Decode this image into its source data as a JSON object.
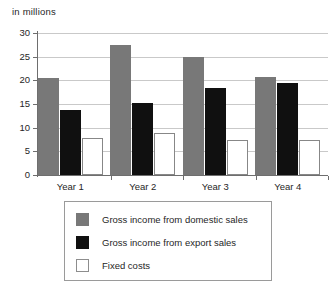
{
  "chart_data": {
    "type": "bar",
    "title": "",
    "subtitle": "",
    "unit_caption": "in millions",
    "xlabel": "",
    "ylabel": "",
    "categories": [
      "Year 1",
      "Year 2",
      "Year 3",
      "Year 4"
    ],
    "series": [
      {
        "name": "Gross income from domestic sales",
        "color": "#787878",
        "values": [
          20.5,
          27.4,
          24.9,
          20.7
        ]
      },
      {
        "name": "Gross income from export sales",
        "color": "#101010",
        "values": [
          13.7,
          15.3,
          18.3,
          19.4
        ]
      },
      {
        "name": "Fixed costs",
        "color": "#ffffff",
        "values": [
          7.8,
          8.8,
          7.3,
          7.3
        ]
      }
    ],
    "ylim": [
      0,
      30
    ],
    "yticks": [
      0,
      5,
      10,
      15,
      20,
      25,
      30
    ],
    "ytick_labels": [
      "0",
      "5",
      "10",
      "15",
      "20",
      "25",
      "30"
    ],
    "grid": true,
    "grid_axis": "y",
    "legend_position": "bottom"
  },
  "legend": {
    "entries": [
      {
        "label": "Gross income from domestic sales",
        "swatch": "legend-swatch-domestic"
      },
      {
        "label": "Gross income from export sales",
        "swatch": "legend-swatch-export"
      },
      {
        "label": "Fixed costs",
        "swatch": "legend-swatch-fixed"
      }
    ]
  }
}
